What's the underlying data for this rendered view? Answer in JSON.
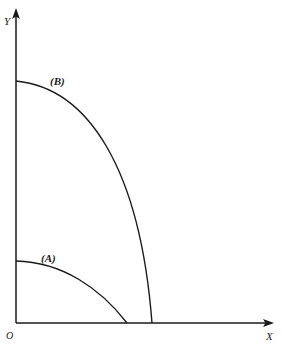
{
  "figure": {
    "name": "coordinate-quarter-arcs-figure",
    "background_color": "#ffffff",
    "stroke_color": "#1a1a1a",
    "width": 283,
    "height": 349
  },
  "axes": {
    "y": {
      "label": "Y",
      "origin_px": [
        16,
        323
      ],
      "tip_px": [
        16,
        10
      ],
      "arrow": "arrow-up"
    },
    "x": {
      "label": "X",
      "origin_px": [
        16,
        323
      ],
      "tip_px": [
        272,
        323
      ],
      "arrow": "arrow-right"
    },
    "origin": {
      "label": "O",
      "px": [
        16,
        323
      ]
    }
  },
  "curves": [
    {
      "id": "A",
      "label": "(A)",
      "description": "smaller concave-down arc, inner curve",
      "y_intercept_px": [
        16,
        261
      ],
      "x_intercept_px": [
        127,
        323
      ],
      "path": "M 16 261 C 62 262, 100 288, 127 323"
    },
    {
      "id": "B",
      "label": "(B)",
      "description": "larger concave-down arc, outer curve",
      "y_intercept_px": [
        16,
        81
      ],
      "x_intercept_px": [
        152,
        323
      ],
      "path": "M 16 81 C 88 88, 140 168, 152 323"
    }
  ],
  "chart_data": {
    "type": "line",
    "title": "",
    "xlabel": "X",
    "ylabel": "Y",
    "grid": false,
    "legend": "inline-annotations",
    "axis_arrows": true,
    "origin_label": "O",
    "xlim": [
      0,
      1
    ],
    "ylim": [
      0,
      1
    ],
    "series": [
      {
        "name": "(A)",
        "note": "inner arc meeting X axis at moderate slope",
        "x": [
          0.0,
          0.12,
          0.24,
          0.36,
          0.47,
          0.57,
          0.66,
          0.74,
          0.81,
          0.87,
          0.92,
          0.96,
          1.0
        ],
        "y": [
          1.0,
          0.995,
          0.975,
          0.94,
          0.89,
          0.825,
          0.745,
          0.65,
          0.54,
          0.42,
          0.29,
          0.15,
          0.0
        ],
        "x_units": "fraction of curve A x-intercept (x=127px)",
        "y_units": "fraction of curve A y-intercept (y=261px)"
      },
      {
        "name": "(B)",
        "note": "outer arc meeting X axis almost vertically",
        "x": [
          0.0,
          0.17,
          0.33,
          0.47,
          0.59,
          0.7,
          0.79,
          0.86,
          0.92,
          0.96,
          0.98,
          0.995,
          1.0
        ],
        "y": [
          1.0,
          0.99,
          0.96,
          0.92,
          0.865,
          0.79,
          0.705,
          0.605,
          0.49,
          0.37,
          0.25,
          0.13,
          0.0
        ],
        "x_units": "fraction of curve B x-intercept (x=152px)",
        "y_units": "fraction of curve B y-intercept (y=81px)"
      }
    ]
  }
}
